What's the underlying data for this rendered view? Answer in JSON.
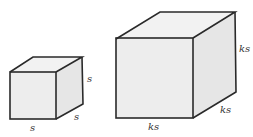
{
  "diagram": {
    "small_cube": {
      "labels": {
        "height": "s",
        "depth": "s",
        "width": "s"
      }
    },
    "large_cube": {
      "labels": {
        "height": "ks",
        "depth": "ks",
        "width": "ks"
      }
    },
    "colors": {
      "face": "#ededed",
      "edge": "#2a2a2a",
      "label": "#333333"
    }
  }
}
